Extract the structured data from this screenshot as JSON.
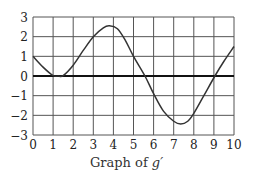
{
  "chart_data": {
    "type": "line",
    "title": "",
    "caption_prefix": "Graph of ",
    "caption_function": "g′",
    "xlabel": "",
    "ylabel": "",
    "xlim": [
      0,
      10
    ],
    "ylim": [
      -3,
      3
    ],
    "grid": true,
    "x_ticks": [
      "0",
      "1",
      "2",
      "3",
      "4",
      "5",
      "6",
      "7",
      "8",
      "9",
      "10"
    ],
    "y_ticks": [
      "3",
      "2",
      "1",
      "0",
      "−1",
      "−2",
      "−3"
    ],
    "series": [
      {
        "name": "g′",
        "x": [
          0,
          0.5,
          1,
          1.25,
          1.5,
          2,
          2.5,
          3,
          3.5,
          3.8,
          4.2,
          4.6,
          5,
          5.57,
          6,
          6.5,
          7,
          7.35,
          7.7,
          8,
          8.5,
          9.05,
          9.5,
          10
        ],
        "values": [
          1,
          0.45,
          0.02,
          0,
          0.02,
          0.55,
          1.3,
          2.0,
          2.45,
          2.55,
          2.4,
          1.8,
          1.0,
          0,
          -0.9,
          -1.8,
          -2.3,
          -2.44,
          -2.3,
          -1.9,
          -1.0,
          0,
          0.75,
          1.5
        ]
      }
    ],
    "colors": {
      "curve": "#333333",
      "grid": "#555555",
      "axis_zero": "#111111"
    }
  }
}
